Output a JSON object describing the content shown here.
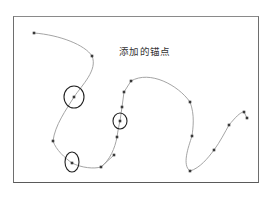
{
  "diagram": {
    "annotation": "添加的锚点",
    "colors": {
      "frame": "#6e6e6e",
      "curve": "#9a9a9a",
      "anchor": "#3a3a3a",
      "circle": "#222222"
    },
    "curve_path": "M34,33 C60,35 85,45 92,56 C98,70 82,85 74,97 C66,110 55,125 53,141 C56,150 65,158 72,163 C82,168 94,169 101,167 L114,155 M101,167 C110,160 115,148 117,137 C118,130 119,125 120,121 L122,107 L124,92 L131,81 M131,81 C150,70 178,85 190,102 C195,115 193,128 192,136 C188,148 182,165 190,171 C200,168 208,158 214,150 C220,142 225,132 229,125 C235,118 240,112 244,112 L247,118",
    "anchors": [
      {
        "x": 34,
        "y": 33
      },
      {
        "x": 92,
        "y": 56
      },
      {
        "x": 74,
        "y": 97
      },
      {
        "x": 53,
        "y": 141
      },
      {
        "x": 72,
        "y": 163
      },
      {
        "x": 101,
        "y": 167
      },
      {
        "x": 114,
        "y": 155
      },
      {
        "x": 117,
        "y": 137
      },
      {
        "x": 120,
        "y": 121
      },
      {
        "x": 122,
        "y": 107
      },
      {
        "x": 124,
        "y": 92
      },
      {
        "x": 131,
        "y": 81
      },
      {
        "x": 190,
        "y": 102
      },
      {
        "x": 192,
        "y": 136
      },
      {
        "x": 190,
        "y": 171
      },
      {
        "x": 214,
        "y": 150
      },
      {
        "x": 229,
        "y": 125
      },
      {
        "x": 244,
        "y": 112
      },
      {
        "x": 247,
        "y": 118
      }
    ],
    "highlighted_anchors": [
      {
        "cx": 74,
        "cy": 97,
        "rx": 10,
        "ry": 11
      },
      {
        "cx": 72,
        "cy": 162,
        "rx": 7,
        "ry": 10
      },
      {
        "cx": 120,
        "cy": 121,
        "rx": 7,
        "ry": 8
      }
    ]
  }
}
